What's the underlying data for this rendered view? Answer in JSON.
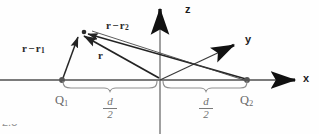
{
  "figure": {
    "kind": "physics-vector-diagram",
    "caption_fragment": "2.5",
    "colors": {
      "background": "#fefefe",
      "axis": "#4a4a4a",
      "axis_dark": "#1d1d1d",
      "vector": "#2b2b2b",
      "brace": "#8a8a8a",
      "charge_dot": "#555555",
      "label_gray": "#6f6f6f"
    }
  },
  "axes": [
    {
      "id": "x",
      "label": "x",
      "direction": "right"
    },
    {
      "id": "y",
      "label": "y",
      "direction": "up-right-oblique"
    },
    {
      "id": "z",
      "label": "z",
      "direction": "up"
    }
  ],
  "charges": [
    {
      "id": "Q1",
      "label": "Q",
      "subscript": "1",
      "position": "-d/2 on x-axis"
    },
    {
      "id": "Q2",
      "label": "Q",
      "subscript": "2",
      "position": "+d/2 on x-axis"
    }
  ],
  "vectors": [
    {
      "id": "r-minus-r1",
      "base": "r",
      "minus": "−",
      "tip": "r",
      "tip_subscript": "1",
      "from": "Q1",
      "to": "field-point"
    },
    {
      "id": "r-minus-r2",
      "base": "r",
      "minus": "−",
      "tip": "r",
      "tip_subscript": "2",
      "from": "Q2",
      "to": "field-point"
    },
    {
      "id": "r",
      "base": "r",
      "from": "origin",
      "to": "field-point"
    }
  ],
  "dimensions": [
    {
      "id": "half-d-left",
      "numerator": "d",
      "denominator": "2",
      "span": "Q1 to origin"
    },
    {
      "id": "half-d-right",
      "numerator": "d",
      "denominator": "2",
      "span": "origin to Q2"
    }
  ]
}
